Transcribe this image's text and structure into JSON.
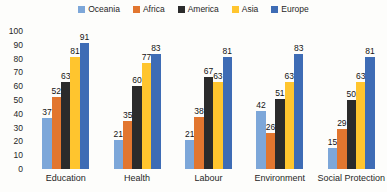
{
  "chart_data": {
    "type": "bar",
    "title": "",
    "categories": [
      "Education",
      "Health",
      "Labour",
      "Environment",
      "Social Protection"
    ],
    "series": [
      {
        "name": "Oceania",
        "color": "#7DA7D9",
        "values": [
          37,
          21,
          21,
          42,
          15
        ]
      },
      {
        "name": "Africa",
        "color": "#E2762F",
        "values": [
          52,
          35,
          38,
          26,
          29
        ]
      },
      {
        "name": "America",
        "color": "#2B2B2B",
        "values": [
          63,
          60,
          67,
          51,
          50
        ]
      },
      {
        "name": "Asia",
        "color": "#FFC52E",
        "values": [
          81,
          77,
          63,
          63,
          63
        ]
      },
      {
        "name": "Europe",
        "color": "#3E6CB5",
        "values": [
          91,
          83,
          81,
          83,
          81
        ]
      }
    ],
    "ylim": [
      0,
      100
    ],
    "y_ticks": [
      100,
      90,
      80,
      70,
      60,
      50,
      40,
      30,
      20,
      10,
      0
    ],
    "grid": false,
    "legend_position": "top",
    "data_labels": true
  }
}
